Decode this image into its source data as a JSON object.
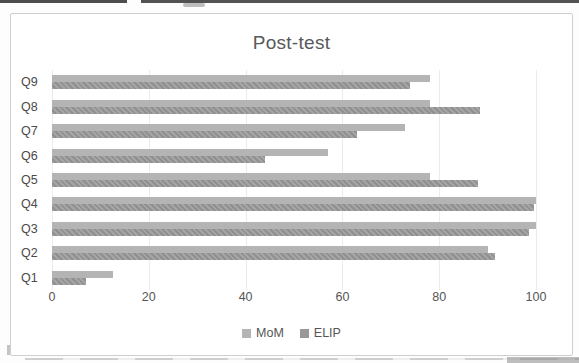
{
  "chart_data": {
    "type": "bar",
    "orientation": "horizontal",
    "title": "Post-test",
    "categories": [
      "Q1",
      "Q2",
      "Q3",
      "Q4",
      "Q5",
      "Q6",
      "Q7",
      "Q8",
      "Q9"
    ],
    "category_order_top_to_bottom": [
      "Q9",
      "Q8",
      "Q7",
      "Q6",
      "Q5",
      "Q4",
      "Q3",
      "Q2",
      "Q1"
    ],
    "series": [
      {
        "name": "MoM",
        "color": "#b4b4b4",
        "values": [
          12.5,
          90,
          100,
          100,
          78,
          57,
          73,
          78,
          78
        ]
      },
      {
        "name": "ELIP",
        "color": "#989898",
        "values": [
          7,
          91.5,
          98.5,
          99.5,
          88,
          44,
          63,
          88.5,
          74
        ]
      }
    ],
    "x_axis": {
      "min": 0,
      "max": 100,
      "tick_interval": 20,
      "tick_labels": [
        "0",
        "20",
        "40",
        "60",
        "80",
        "100"
      ]
    },
    "grid": true,
    "legend_position": "bottom"
  }
}
